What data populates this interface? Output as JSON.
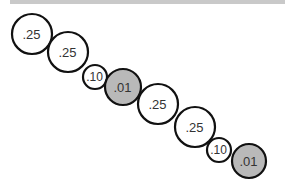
{
  "diagram": {
    "colors": {
      "stroke": "#111111",
      "empty_fill": "#ffffff",
      "filled_fill": "#b9b9b9",
      "top_band": "#c9c9c9"
    },
    "nodes": [
      {
        "label": ".25",
        "cx": 32,
        "cy": 34,
        "r": 20,
        "filled": false
      },
      {
        "label": ".25",
        "cx": 68,
        "cy": 52,
        "r": 20,
        "filled": false
      },
      {
        "label": ".10",
        "cx": 95,
        "cy": 77,
        "r": 12,
        "filled": false
      },
      {
        "label": ".01",
        "cx": 123,
        "cy": 87,
        "r": 18,
        "filled": true
      },
      {
        "label": ".25",
        "cx": 158,
        "cy": 104,
        "r": 20,
        "filled": false
      },
      {
        "label": ".25",
        "cx": 195,
        "cy": 127,
        "r": 20,
        "filled": false
      },
      {
        "label": ".10",
        "cx": 219,
        "cy": 150,
        "r": 12,
        "filled": false
      },
      {
        "label": ".01",
        "cx": 249,
        "cy": 161,
        "r": 17,
        "filled": true
      }
    ]
  }
}
